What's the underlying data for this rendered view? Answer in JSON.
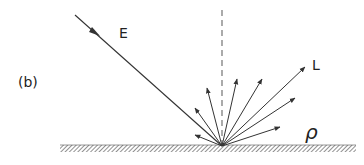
{
  "diagram": {
    "panel_label": "(b)",
    "incident_label": "E",
    "reflected_label": "L",
    "reflectance_label": "ρ",
    "colors": {
      "line": "#333333",
      "ground_hatch": "#555555",
      "normal": "#666666"
    }
  }
}
